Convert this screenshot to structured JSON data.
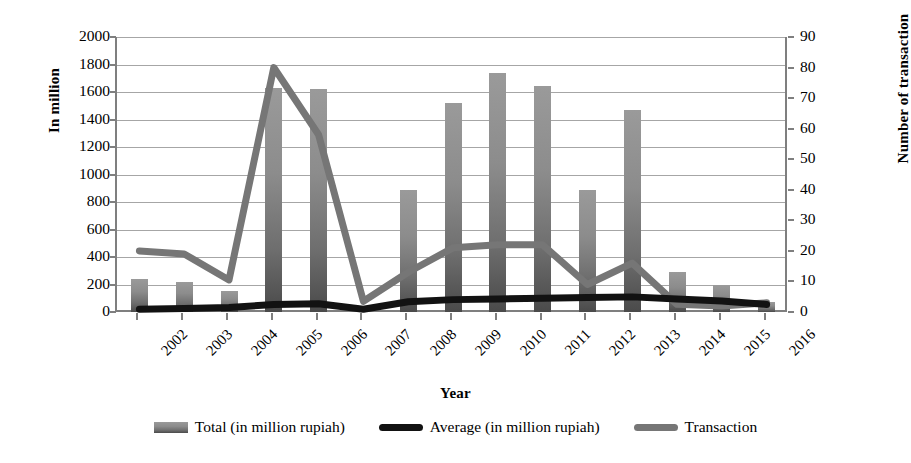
{
  "chart_data": {
    "type": "bar",
    "title": "",
    "xlabel": "Year",
    "ylabel": "In million",
    "y2label": "Number of transaction",
    "categories": [
      "2002",
      "2003",
      "2004",
      "2005",
      "2006",
      "2007",
      "2008",
      "2009",
      "2010",
      "2011",
      "2012",
      "2013",
      "2014",
      "2015",
      "2016"
    ],
    "ylim": [
      0,
      2000
    ],
    "y2lim": [
      0,
      90
    ],
    "yticks": [
      0,
      200,
      400,
      600,
      800,
      1000,
      1200,
      1400,
      1600,
      1800,
      2000
    ],
    "y2ticks": [
      0,
      10,
      20,
      30,
      40,
      50,
      60,
      70,
      80,
      90
    ],
    "grid": true,
    "legend_position": "bottom",
    "series": [
      {
        "name": "Total  (in million rupiah)",
        "type": "bar",
        "axis": "left",
        "color": "#8c8c8c",
        "values": [
          240,
          215,
          150,
          1630,
          1620,
          0,
          885,
          1520,
          1740,
          1645,
          890,
          1470,
          290,
          195,
          70
        ]
      },
      {
        "name": "Average (in million rupiah)",
        "type": "line",
        "axis": "left",
        "color": "#121212",
        "values": [
          20,
          25,
          32,
          55,
          60,
          20,
          75,
          90,
          95,
          100,
          105,
          110,
          95,
          80,
          55
        ]
      },
      {
        "name": "Transaction",
        "type": "line",
        "axis": "right",
        "color": "#767676",
        "values": [
          20,
          19,
          10.5,
          80,
          58,
          3.5,
          13,
          21,
          22,
          22,
          9,
          16,
          2.5,
          2,
          3
        ]
      }
    ]
  },
  "axes": {
    "left_title": "In million",
    "right_title": "Number of transaction",
    "x_title": "Year",
    "left_ticks": [
      "2000",
      "1800",
      "1600",
      "1400",
      "1200",
      "1000",
      "800",
      "600",
      "400",
      "200",
      "0"
    ],
    "right_ticks": [
      "90",
      "80",
      "70",
      "60",
      "50",
      "40",
      "30",
      "20",
      "10",
      "0"
    ],
    "x_ticks": [
      "2002",
      "2003",
      "2004",
      "2005",
      "2006",
      "2007",
      "2008",
      "2009",
      "2010",
      "2011",
      "2012",
      "2013",
      "2014",
      "2015",
      "2016"
    ]
  },
  "legend": {
    "items": [
      {
        "label": "Total  (in million rupiah)",
        "kind": "bar"
      },
      {
        "label": "Average (in million rupiah)",
        "kind": "line-black"
      },
      {
        "label": "Transaction",
        "kind": "line-gray"
      }
    ]
  }
}
